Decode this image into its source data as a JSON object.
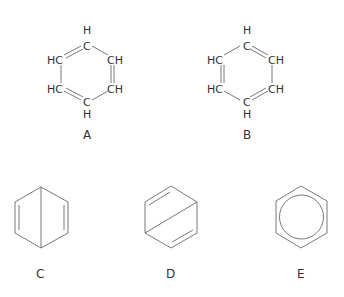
{
  "structures": [
    {
      "label": "A",
      "atoms": {
        "top_h": "H",
        "top_c": "C",
        "upper_left": "HC",
        "upper_right": "CH",
        "lower_left": "HC",
        "lower_right": "CH",
        "bottom_c": "C",
        "bottom_h": "H"
      }
    },
    {
      "label": "B",
      "atoms": {
        "top_h": "H",
        "top_c": "C",
        "upper_left": "HC",
        "upper_right": "CH",
        "lower_left": "HC",
        "lower_right": "CH",
        "bottom_c": "C",
        "bottom_h": "H"
      }
    },
    {
      "label": "C"
    },
    {
      "label": "D"
    },
    {
      "label": "E"
    }
  ],
  "colors": {
    "line": "#555555",
    "text": "#333333"
  }
}
